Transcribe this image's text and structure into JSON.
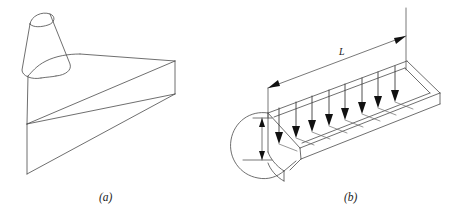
{
  "figure": {
    "background_color": "#ffffff",
    "line_color": "#4a4a4a",
    "arrow_color": "#111111",
    "text_color": "#1a1a1a",
    "width": 454,
    "height": 221
  },
  "panels": [
    {
      "id": "a",
      "caption": "(a)",
      "caption_x": 99,
      "caption_y": 201,
      "description": "isometric view of cylindrical neck flaring into wedge-shaped slab"
    },
    {
      "id": "b",
      "caption": "(b)",
      "caption_x": 344,
      "caption_y": 201,
      "description": "slab with rounded end, length dimension L, height dimension and distributed downward loads"
    }
  ],
  "dimensions": [
    {
      "name": "length",
      "label": "L",
      "label_x": 339,
      "label_y": 55,
      "orientation": "diagonal",
      "arrowheads": "both"
    },
    {
      "name": "height",
      "label": "",
      "orientation": "vertical",
      "arrowheads": "both"
    }
  ],
  "loads": {
    "name": "distributed-load-arrows",
    "count": 8,
    "direction": "downward",
    "arrow_positions": [
      {
        "x": 279,
        "y_top": 108,
        "y_tip": 143
      },
      {
        "x": 296,
        "y_top": 102,
        "y_tip": 137
      },
      {
        "x": 312,
        "y_top": 96,
        "y_tip": 131
      },
      {
        "x": 329,
        "y_top": 90,
        "y_tip": 125
      },
      {
        "x": 345,
        "y_top": 84,
        "y_tip": 119
      },
      {
        "x": 362,
        "y_top": 78,
        "y_tip": 113
      },
      {
        "x": 378,
        "y_top": 72,
        "y_tip": 107
      },
      {
        "x": 395,
        "y_top": 66,
        "y_tip": 101
      }
    ]
  }
}
